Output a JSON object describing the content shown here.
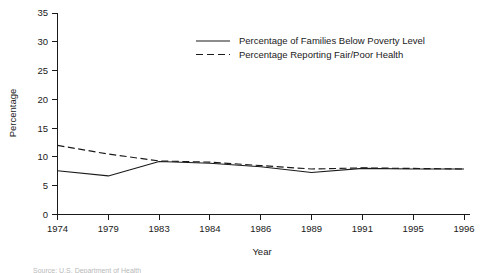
{
  "chart_data": {
    "type": "line",
    "title": "",
    "xlabel": "Year",
    "ylabel": "Percentage",
    "categories": [
      "1974",
      "1979",
      "1983",
      "1984",
      "1986",
      "1989",
      "1991",
      "1995",
      "1996"
    ],
    "ylim": [
      0,
      35
    ],
    "yticks": [
      0,
      5,
      10,
      15,
      20,
      25,
      30,
      35
    ],
    "grid": false,
    "legend_position": "top-center",
    "series": [
      {
        "name": "Percentage of Families Below Poverty Level",
        "style": "solid",
        "color": "#1a1a1a",
        "values": [
          7.6,
          6.7,
          9.2,
          8.9,
          8.3,
          7.3,
          8.0,
          7.9,
          7.9
        ]
      },
      {
        "name": "Percentage Reporting Fair/Poor Health",
        "style": "dashed",
        "color": "#1a1a1a",
        "values": [
          12.0,
          10.5,
          9.3,
          9.1,
          8.5,
          7.9,
          8.1,
          8.0,
          7.9
        ]
      }
    ]
  },
  "axis": {
    "x_title": "Year",
    "y_title": "Percentage"
  },
  "legend": {
    "items": [
      {
        "label": "Percentage of Families Below Poverty Level",
        "style": "solid"
      },
      {
        "label": "Percentage Reporting Fair/Poor Health",
        "style": "dashed"
      }
    ]
  },
  "footer": {
    "source_fragment": "Source: U.S. Department of Health"
  }
}
